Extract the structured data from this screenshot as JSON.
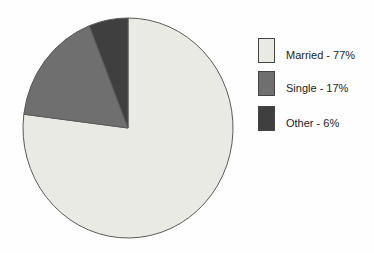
{
  "chart_data": {
    "type": "pie",
    "title": "",
    "categories": [
      "Married",
      "Single",
      "Other"
    ],
    "values": [
      77,
      17,
      6
    ],
    "unit": "%",
    "colors": [
      "#e9eae4",
      "#6f6f6f",
      "#3f3f3f"
    ],
    "stroke_color": "#5a5a5a",
    "start_angle_deg": 0,
    "direction": "clockwise",
    "legend_position": "right",
    "legend": [
      {
        "label": "Married - 77%",
        "color": "#e9eae4"
      },
      {
        "label": "Single - 17%",
        "color": "#6f6f6f"
      },
      {
        "label": "Other - 6%",
        "color": "#3f3f3f"
      }
    ]
  }
}
